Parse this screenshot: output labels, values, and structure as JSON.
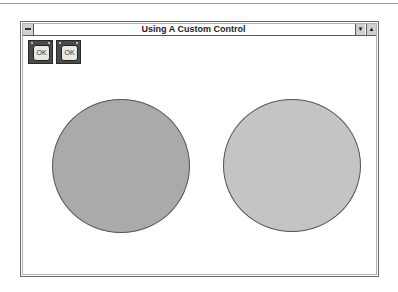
{
  "window": {
    "title": "Using A Custom Control",
    "system_menu_icon": "system-menu-icon",
    "minimize_glyph": "▼",
    "maximize_glyph": "▲"
  },
  "buttons": [
    {
      "label": "OK"
    },
    {
      "label": "OK"
    }
  ],
  "shapes": [
    {
      "type": "circle",
      "color": "#aaaaaa"
    },
    {
      "type": "circle",
      "color": "#c4c4c4"
    }
  ]
}
